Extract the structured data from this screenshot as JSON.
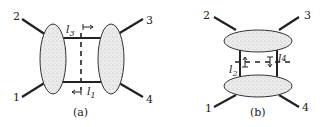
{
  "diagram": {
    "panel_a": {
      "caption": "(a)",
      "external_legs": [
        "1",
        "2",
        "3",
        "4"
      ],
      "cut_lines": [
        {
          "label_base": "l",
          "label_sub": "3",
          "arrow": "↦"
        },
        {
          "label_base": "l",
          "label_sub": "1",
          "arrow": "↤"
        }
      ]
    },
    "panel_b": {
      "caption": "(b)",
      "external_legs": [
        "1",
        "2",
        "3",
        "4"
      ],
      "cut_lines": [
        {
          "label_base": "l",
          "label_sub": "2",
          "arrow": "↥"
        },
        {
          "label_base": "l",
          "label_sub": "4",
          "arrow": "↧"
        }
      ]
    },
    "colors": {
      "line": "#222222",
      "blob_fill": "#e4e4e4",
      "blob_stroke": "#333333"
    }
  }
}
